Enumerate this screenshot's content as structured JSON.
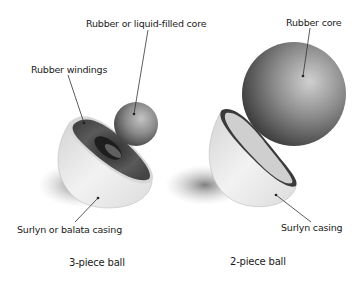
{
  "diagram": {
    "left": {
      "caption": "3-piece ball",
      "labels": {
        "core": "Rubber or liquid-filled core",
        "windings": "Rubber windings",
        "casing": "Surlyn or balata casing"
      }
    },
    "right": {
      "caption": "2-piece ball",
      "labels": {
        "core": "Rubber core",
        "casing": "Surlyn casing"
      }
    }
  },
  "colors": {
    "background": "#ffffff",
    "casing": "#e6e6e6",
    "core_dark": "#3a3a3a",
    "windings": "#4a4a4a",
    "text": "#1a1a1a"
  }
}
